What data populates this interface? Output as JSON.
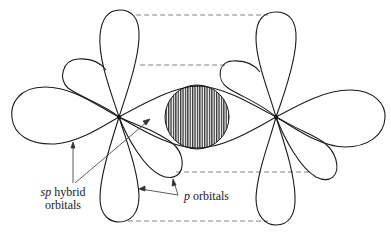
{
  "diagram": {
    "labels": {
      "sp_prefix": "sp",
      "sp_suffix": " hybrid",
      "sp_line2": "orbitals",
      "p_prefix": "p",
      "p_suffix": " orbitals"
    },
    "colors": {
      "stroke": "#1a1a1a",
      "dash": "#777777",
      "hatch": "#333333",
      "background": "#ffffff"
    },
    "atoms": [
      {
        "name": "left-atom",
        "x": 119,
        "y": 117
      },
      {
        "name": "right-atom",
        "x": 276,
        "y": 117
      }
    ],
    "overlap_region": {
      "cx": 197,
      "cy": 117,
      "r": 32,
      "fill": "vertical-hatch"
    },
    "dashed_lines_y": [
      15,
      65,
      172,
      221
    ]
  }
}
